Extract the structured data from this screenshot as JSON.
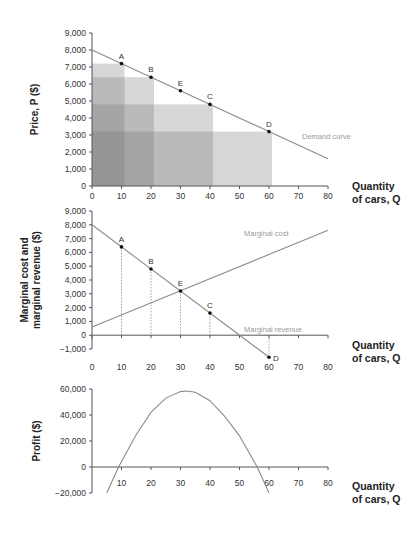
{
  "chart_data": [
    {
      "type": "line",
      "title": "",
      "xlabel": "Quantity of cars, Q",
      "xlabel_lines": [
        "Quantity",
        "of cars, Q"
      ],
      "ylabel": "Price, P ($)",
      "xlim": [
        0,
        80
      ],
      "ylim": [
        0,
        9000
      ],
      "xticks": [
        0,
        10,
        20,
        30,
        40,
        50,
        60,
        70,
        80
      ],
      "yticks": [
        0,
        1000,
        2000,
        3000,
        4000,
        5000,
        6000,
        7000,
        8000,
        9000
      ],
      "ytick_labels": [
        "0",
        "1,000",
        "2,000",
        "3,000",
        "4,000",
        "5,000",
        "6,000",
        "7,000",
        "8,000",
        "9,000"
      ],
      "grid": false,
      "series": [
        {
          "name": "Demand curve",
          "x": [
            0,
            80
          ],
          "y": [
            8000,
            1600
          ]
        }
      ],
      "points": [
        {
          "label": "A",
          "x": 10,
          "y": 7200
        },
        {
          "label": "B",
          "x": 20,
          "y": 6400
        },
        {
          "label": "E",
          "x": 30,
          "y": 5600
        },
        {
          "label": "C",
          "x": 40,
          "y": 4800
        },
        {
          "label": "D",
          "x": 60,
          "y": 3200
        }
      ],
      "shaded_revenue_rectangles": [
        {
          "point": "A",
          "q": 10,
          "p": 7200
        },
        {
          "point": "B",
          "q": 20,
          "p": 6400
        },
        {
          "point": "C",
          "q": 40,
          "p": 4800
        },
        {
          "point": "D",
          "q": 60,
          "p": 3200
        }
      ],
      "annotations": [
        "Demand curve"
      ]
    },
    {
      "type": "line",
      "title": "",
      "xlabel": "Quantity of cars, Q",
      "xlabel_lines": [
        "Quantity",
        "of cars, Q"
      ],
      "ylabel": "Marginal cost and marginal revenue ($)",
      "ylabel_lines": [
        "Marginal cost and",
        "marginal revenue ($)"
      ],
      "xlim": [
        0,
        80
      ],
      "ylim": [
        -1000,
        9000
      ],
      "xticks": [
        0,
        10,
        20,
        30,
        40,
        50,
        60,
        70,
        80
      ],
      "yticks": [
        -1000,
        0,
        1000,
        2000,
        3000,
        4000,
        5000,
        6000,
        7000,
        8000,
        9000
      ],
      "ytick_labels": [
        "−1,000",
        "0",
        "1,000",
        "2,000",
        "3,000",
        "4,000",
        "5,000",
        "6,000",
        "7,000",
        "8,000",
        "9,000"
      ],
      "grid": false,
      "series": [
        {
          "name": "Marginal cost",
          "x": [
            0,
            80
          ],
          "y": [
            600,
            7600
          ]
        },
        {
          "name": "Marginal revenue",
          "x": [
            0,
            60
          ],
          "y": [
            8000,
            -1600
          ]
        }
      ],
      "points": [
        {
          "label": "A",
          "x": 10,
          "y": 6400
        },
        {
          "label": "B",
          "x": 20,
          "y": 4800
        },
        {
          "label": "E",
          "x": 30,
          "y": 3200
        },
        {
          "label": "C",
          "x": 40,
          "y": 1600
        },
        {
          "label": "D",
          "x": 60,
          "y": -1600
        }
      ],
      "annotations": [
        "Marginal cost",
        "Marginal revenue"
      ]
    },
    {
      "type": "line",
      "title": "",
      "xlabel": "Quantity of cars, Q",
      "xlabel_lines": [
        "Quantity",
        "of cars, Q"
      ],
      "ylabel": "Profit ($)",
      "xlim": [
        0,
        80
      ],
      "ylim": [
        -20000,
        60000
      ],
      "xticks": [
        10,
        20,
        30,
        40,
        50,
        60,
        70,
        80
      ],
      "yticks": [
        -20000,
        0,
        20000,
        40000,
        60000
      ],
      "ytick_labels": [
        "−20,000",
        "0",
        "20,000",
        "40,000",
        "60,000"
      ],
      "grid": false,
      "series": [
        {
          "name": "Profit",
          "x": [
            5,
            9,
            15,
            20,
            25,
            30,
            32,
            35,
            40,
            45,
            50,
            56,
            60
          ],
          "y": [
            -20000,
            0,
            25000,
            42000,
            53000,
            58000,
            58500,
            57500,
            51000,
            39000,
            24000,
            0,
            -20000
          ]
        }
      ],
      "annotations": []
    }
  ]
}
